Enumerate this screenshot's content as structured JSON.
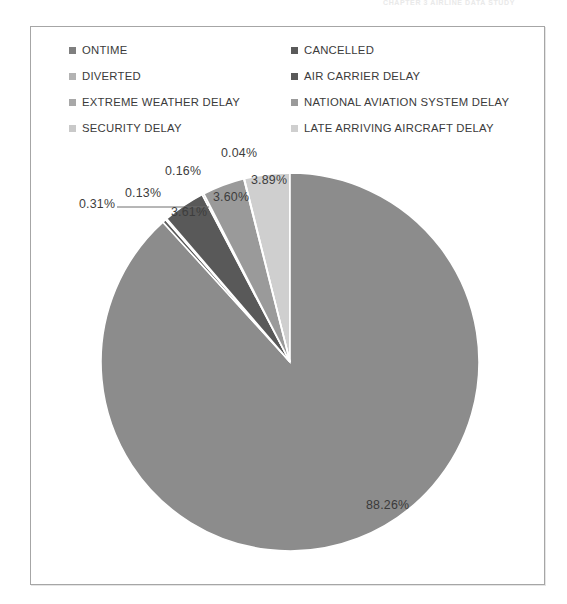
{
  "running_header": "CHAPTER 3   AIRLINE DATA STUDY",
  "chart_data": {
    "type": "pie",
    "title": "",
    "legend_position": "top",
    "grid": false,
    "units": "percent",
    "categories": [
      "ONTIME",
      "CANCELLED",
      "DIVERTED",
      "AIR CARRIER DELAY",
      "EXTREME WEATHER DELAY",
      "NATIONAL AVIATION SYSTEM DELAY",
      "SECURITY DELAY",
      "LATE ARRIVING AIRCRAFT DELAY"
    ],
    "values": [
      88.26,
      0.31,
      0.13,
      3.61,
      0.16,
      3.6,
      0.04,
      3.89
    ],
    "labels": [
      "88.26%",
      "0.31%",
      "0.13%",
      "3.61%",
      "0.16%",
      "3.60%",
      "0.04%",
      "3.89%"
    ],
    "colors": [
      "#8c8c8c",
      "#5a5a5a",
      "#b3b3b3",
      "#595959",
      "#a8a8a8",
      "#9a9a9a",
      "#c9c9c9",
      "#cfcfcf"
    ]
  },
  "legend": {
    "rows": [
      {
        "left": {
          "label": "ONTIME",
          "color": "#7f7f7f"
        },
        "right": {
          "label": "CANCELLED",
          "color": "#5a5a5a"
        }
      },
      {
        "left": {
          "label": "DIVERTED",
          "color": "#b3b3b3"
        },
        "right": {
          "label": "AIR CARRIER DELAY",
          "color": "#595959"
        }
      },
      {
        "left": {
          "label": "EXTREME WEATHER DELAY",
          "color": "#a8a8a8"
        },
        "right": {
          "label": "NATIONAL AVIATION SYSTEM DELAY",
          "color": "#9a9a9a"
        }
      },
      {
        "left": {
          "label": "SECURITY DELAY",
          "color": "#c9c9c9"
        },
        "right": {
          "label": "LATE ARRIVING AIRCRAFT DELAY",
          "color": "#cfcfcf"
        }
      }
    ]
  },
  "data_labels": [
    {
      "name": "slice-label-diverted",
      "text": "0.31%",
      "x": 48,
      "y": 170
    },
    {
      "name": "slice-label-cancelled",
      "text": "0.13%",
      "x": 94,
      "y": 159
    },
    {
      "name": "slice-label-extreme-weather",
      "text": "0.16%",
      "x": 134,
      "y": 137
    },
    {
      "name": "slice-label-security",
      "text": "0.04%",
      "x": 190,
      "y": 119
    },
    {
      "name": "slice-label-air-carrier",
      "text": "3.61%",
      "x": 140,
      "y": 178
    },
    {
      "name": "slice-label-national-aviation",
      "text": "3.60%",
      "x": 182,
      "y": 163
    },
    {
      "name": "slice-label-late-arriving",
      "text": "3.89%",
      "x": 220,
      "y": 146
    },
    {
      "name": "slice-label-ontime",
      "text": "88.26%",
      "x": 335,
      "y": 471
    }
  ],
  "geometry": {
    "cx": 259,
    "cy": 335,
    "r": 189,
    "leader_line": {
      "x1": 86,
      "y1": 180,
      "x2": 178,
      "y2": 180
    }
  }
}
